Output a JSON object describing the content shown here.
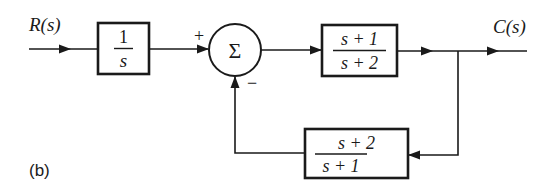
{
  "diagram": {
    "type": "block-diagram",
    "caption": "(b)",
    "input": {
      "label": "R(s)"
    },
    "output": {
      "label": "C(s)"
    },
    "blocks": [
      {
        "id": "integrator",
        "numerator": "1",
        "denominator": "s"
      },
      {
        "id": "forward",
        "numerator": "s + 1",
        "denominator": "s + 2"
      },
      {
        "id": "feedback",
        "numerator": "s + 2",
        "denominator": "s + 1"
      }
    ],
    "summing_junction": {
      "symbol": "Σ",
      "plus_sign": "+",
      "minus_sign": "−"
    },
    "connections": [
      "R(s) → 1/s",
      "1/s → Σ (+)",
      "Σ → (s+1)/(s+2)",
      "(s+1)/(s+2) → C(s)",
      "C(s) → (s+2)/(s+1)",
      "(s+2)/(s+1) → Σ (−)"
    ]
  }
}
